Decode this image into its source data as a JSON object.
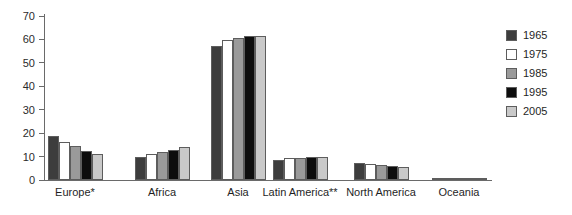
{
  "chart_data": {
    "type": "bar",
    "title": "",
    "xlabel": "",
    "ylabel": "",
    "ylim": [
      0,
      70
    ],
    "ytick_step": 10,
    "yticks": [
      70,
      60,
      50,
      40,
      30,
      20,
      10,
      0
    ],
    "grid": false,
    "legend_position": "right",
    "categories": [
      "Europe*",
      "Africa",
      "Asia",
      "Latin America**",
      "North America",
      "Oceania"
    ],
    "series": [
      {
        "name": "1965",
        "color": "#3d3d3d",
        "values": [
          18.7,
          9.8,
          57.1,
          8.6,
          7.4,
          0.5
        ]
      },
      {
        "name": "1975",
        "color": "#ffffff",
        "values": [
          16.2,
          11.0,
          59.6,
          9.2,
          6.7,
          0.5
        ]
      },
      {
        "name": "1985",
        "color": "#9a9a9a",
        "values": [
          14.5,
          12.1,
          60.6,
          9.5,
          6.3,
          0.5
        ]
      },
      {
        "name": "1995",
        "color": "#0d0d0d",
        "values": [
          12.3,
          13.0,
          61.3,
          9.7,
          5.9,
          0.5
        ]
      },
      {
        "name": "2005",
        "color": "#c9c9c9",
        "values": [
          11.3,
          14.3,
          61.5,
          9.8,
          5.6,
          0.5
        ]
      }
    ]
  },
  "legend": {
    "entries": [
      {
        "label": "1965",
        "color": "#3d3d3d"
      },
      {
        "label": "1975",
        "color": "#ffffff"
      },
      {
        "label": "1985",
        "color": "#9a9a9a"
      },
      {
        "label": "1995",
        "color": "#0d0d0d"
      },
      {
        "label": "2005",
        "color": "#c9c9c9"
      }
    ]
  },
  "axis": {
    "y_tick_labels": [
      "70",
      "60",
      "50",
      "40",
      "30",
      "20",
      "10",
      "0"
    ]
  }
}
